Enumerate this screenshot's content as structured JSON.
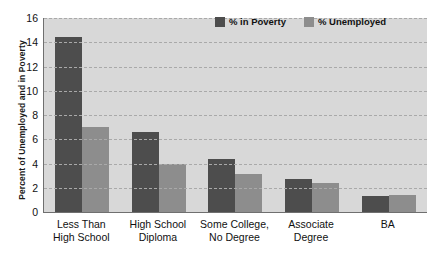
{
  "chart_data": {
    "type": "bar",
    "title": "",
    "xlabel": "",
    "ylabel": "Percent of Unemployed and in Poverty",
    "ylim": [
      0,
      16
    ],
    "ytick_values": [
      16,
      14,
      12,
      10,
      8,
      6,
      4,
      2,
      0
    ],
    "grid": true,
    "legend_position": "top-right",
    "categories": [
      "Less Than\nHigh School",
      "High School\nDiploma",
      "Some College,\nNo Degree",
      "Associate\nDegree",
      "BA"
    ],
    "category_lines": [
      [
        "Less Than",
        "High School"
      ],
      [
        "High School",
        "Diploma"
      ],
      [
        "Some College,",
        "No Degree"
      ],
      [
        "Associate",
        "Degree"
      ],
      [
        "BA",
        ""
      ]
    ],
    "series": [
      {
        "name": "% in Poverty",
        "color": "#4d4d4d",
        "values": [
          14.4,
          6.6,
          4.4,
          2.7,
          1.3
        ]
      },
      {
        "name": "% Unemployed",
        "color": "#8d8d8d",
        "values": [
          7.0,
          4.0,
          3.1,
          2.4,
          1.4
        ]
      }
    ]
  },
  "legend": {
    "items": [
      {
        "label": "% in Poverty",
        "color": "#4d4d4d"
      },
      {
        "label": "% Unemployed",
        "color": "#8d8d8d"
      }
    ]
  },
  "colors": {
    "plot_background": "#d8d8d8",
    "gridline": "#a9a9a9",
    "axis": "#6f6f6f",
    "series_poverty": "#4d4d4d",
    "series_unemployed": "#8d8d8d"
  }
}
